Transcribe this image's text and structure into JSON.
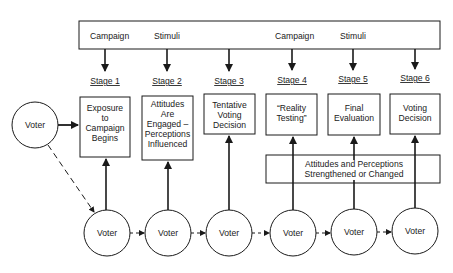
{
  "diagram": {
    "title": "",
    "banner": {
      "words": [
        "Campaign",
        "Stimuli",
        "Campaign",
        "Stimuli"
      ]
    },
    "stages": [
      {
        "label": "Stage 1",
        "lines": [
          "Exposure",
          "to",
          "Campaign",
          "Begins"
        ]
      },
      {
        "label": "Stage 2",
        "lines": [
          "Attitudes",
          "Are",
          "Engaged –",
          "Perceptions",
          "Influenced"
        ]
      },
      {
        "label": "Stage 3",
        "lines": [
          "Tentative",
          "Voting",
          "Decision"
        ]
      },
      {
        "label": "Stage 4",
        "lines": [
          "“Reality",
          "Testing”"
        ]
      },
      {
        "label": "Stage 5",
        "lines": [
          "Final",
          "Evaluation"
        ]
      },
      {
        "label": "Stage 6",
        "lines": [
          "Voting",
          "Decision"
        ]
      }
    ],
    "attitudes_box": {
      "lines": [
        "Attitudes and Perceptions",
        "Strengthened or Changed"
      ]
    },
    "start_voter": {
      "label": "Voter"
    },
    "voters": [
      {
        "label": "Voter"
      },
      {
        "label": "Voter"
      },
      {
        "label": "Voter"
      },
      {
        "label": "Voter"
      },
      {
        "label": "Voter"
      },
      {
        "label": "Voter"
      }
    ]
  }
}
